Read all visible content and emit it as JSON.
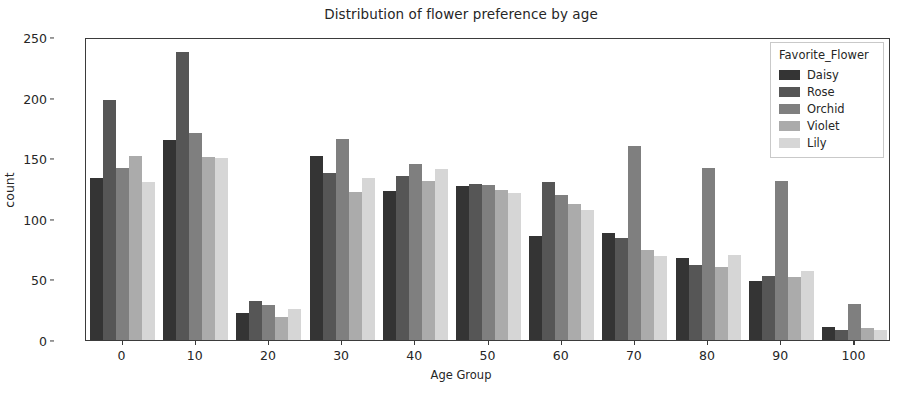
{
  "chart_data": {
    "type": "bar",
    "title": "Distribution of flower preference by age",
    "xlabel": "Age Group",
    "ylabel": "count",
    "grid": false,
    "legend_position": "upper right",
    "legend_title": "Favorite_Flower",
    "ylim": [
      0,
      250
    ],
    "ytick_labels": [
      "0",
      "50",
      "100",
      "150",
      "200",
      "250"
    ],
    "yticks": [
      0,
      50,
      100,
      150,
      200,
      250
    ],
    "categories": [
      "0",
      "10",
      "20",
      "30",
      "40",
      "50",
      "60",
      "70",
      "80",
      "90",
      "100"
    ],
    "series": [
      {
        "name": "Daisy",
        "color": "#343434",
        "values": [
          134,
          165,
          22,
          152,
          123,
          127,
          86,
          88,
          68,
          49,
          11
        ]
      },
      {
        "name": "Rose",
        "color": "#565656",
        "values": [
          198,
          238,
          32,
          138,
          135,
          129,
          130,
          84,
          62,
          53,
          8
        ]
      },
      {
        "name": "Orchid",
        "color": "#7f7f7f",
        "values": [
          142,
          171,
          29,
          166,
          145,
          128,
          120,
          160,
          142,
          131,
          30
        ]
      },
      {
        "name": "Violet",
        "color": "#ababab",
        "values": [
          152,
          151,
          19,
          122,
          131,
          124,
          112,
          74,
          60,
          52,
          10
        ]
      },
      {
        "name": "Lily",
        "color": "#d6d6d6",
        "values": [
          130,
          150,
          26,
          134,
          141,
          121,
          107,
          69,
          70,
          57,
          8
        ]
      }
    ]
  },
  "legend": {
    "title": "Favorite_Flower",
    "items": [
      {
        "label": "Daisy",
        "color": "#343434"
      },
      {
        "label": "Rose",
        "color": "#565656"
      },
      {
        "label": "Orchid",
        "color": "#7f7f7f"
      },
      {
        "label": "Violet",
        "color": "#ababab"
      },
      {
        "label": "Lily",
        "color": "#d6d6d6"
      }
    ]
  }
}
